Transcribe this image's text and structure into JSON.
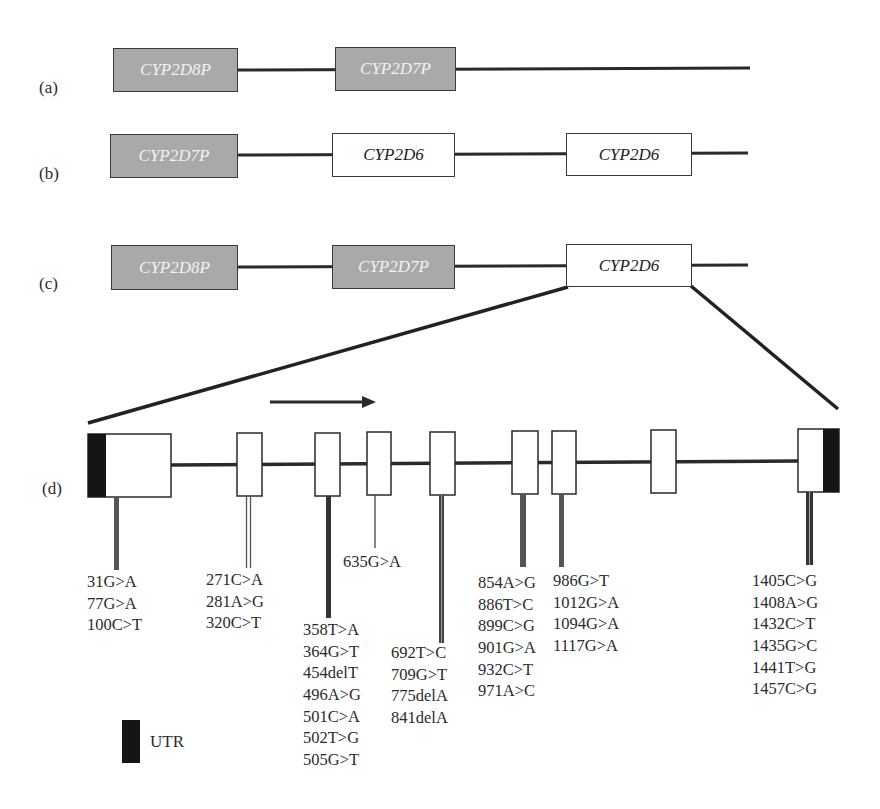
{
  "panels": {
    "a": {
      "label": "(a)",
      "genes": [
        {
          "name": "CYP2D8P",
          "type": "pseudogene"
        },
        {
          "name": "CYP2D7P",
          "type": "pseudogene"
        }
      ]
    },
    "b": {
      "label": "(b)",
      "genes": [
        {
          "name": "CYP2D7P",
          "type": "pseudogene"
        },
        {
          "name": "CYP2D6",
          "type": "functional"
        },
        {
          "name": "CYP2D6",
          "type": "functional"
        }
      ]
    },
    "c": {
      "label": "(c)",
      "genes": [
        {
          "name": "CYP2D8P",
          "type": "pseudogene"
        },
        {
          "name": "CYP2D7P",
          "type": "pseudogene"
        },
        {
          "name": "CYP2D6",
          "type": "functional"
        }
      ]
    },
    "d": {
      "label": "(d)",
      "exon_count": 9,
      "direction": "left-to-right",
      "variant_groups": [
        {
          "exon": 1,
          "variants": [
            "31G>A",
            "77G>A",
            "100C>T"
          ]
        },
        {
          "exon": 2,
          "variants": [
            "271C>A",
            "281A>G",
            "320C>T"
          ]
        },
        {
          "exon": 3,
          "variants": [
            "358T>A",
            "364G>T",
            "454delT",
            "496A>G",
            "501C>A",
            "502T>G",
            "505G>T"
          ]
        },
        {
          "exon": 4,
          "variants": [
            "635G>A"
          ]
        },
        {
          "exon": 5,
          "variants": [
            "692T>C",
            "709G>T",
            "775delA",
            "841delA"
          ]
        },
        {
          "exon": 6,
          "variants": [
            "854A>G",
            "886T>C",
            "899C>G",
            "901G>A",
            "932C>T",
            "971A>C"
          ]
        },
        {
          "exon": 7,
          "variants": [
            "986G>T",
            "1012G>A",
            "1094G>A",
            "1117G>A"
          ]
        },
        {
          "exon": 9,
          "variants": [
            "1405C>G",
            "1408A>G",
            "1432C>T",
            "1435G>C",
            "1441T>G",
            "1457C>G"
          ]
        }
      ]
    }
  },
  "legend": {
    "items": [
      {
        "label": "UTR",
        "color": "#151515"
      }
    ]
  },
  "colors": {
    "pseudogene_fill": "#a9a9a9",
    "pseudogene_text": "#f2f2f2",
    "functional_fill": "#ffffff",
    "line": "#2a2a2a",
    "utr": "#151515"
  }
}
